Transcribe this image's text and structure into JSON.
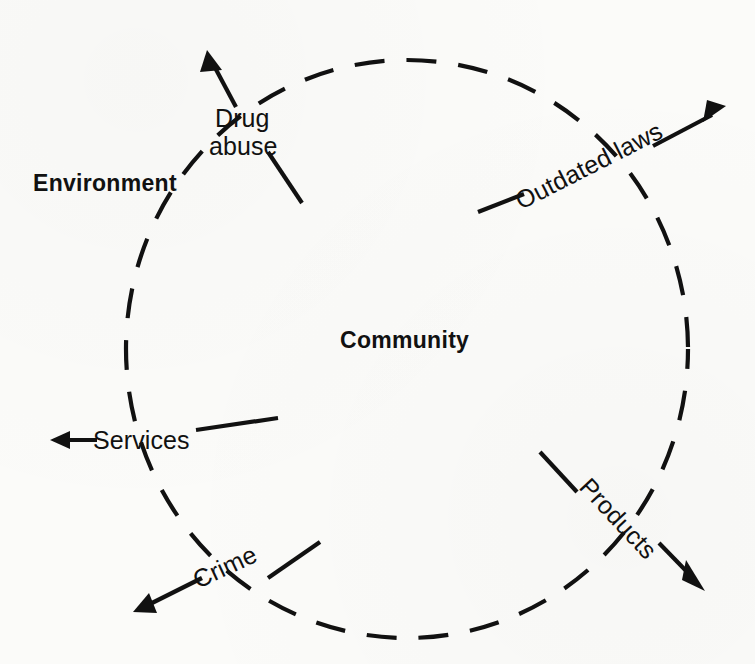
{
  "figure": {
    "region_outside_label": "Environment",
    "region_inside_label": "Community",
    "stroke_color": "#111111",
    "background_color": "#fbfbf9"
  },
  "boundary": {
    "name": "community-boundary",
    "style": "dashed",
    "center_x": 407,
    "center_y": 349,
    "radius_x": 281,
    "radius_y": 289
  },
  "flows": [
    {
      "label": "Drug abuse",
      "label_line_1": "Drug",
      "label_line_2": "abuse",
      "direction": "outward",
      "arrow_angle_deg": 297
    },
    {
      "label": "Outdated laws",
      "direction": "outward",
      "arrow_angle_deg": 332
    },
    {
      "label": "Products",
      "direction": "outward",
      "arrow_angle_deg": 45
    },
    {
      "label": "Crime",
      "direction": "outward",
      "arrow_angle_deg": 155
    },
    {
      "label": "Services",
      "direction": "outward",
      "arrow_angle_deg": 180
    }
  ]
}
